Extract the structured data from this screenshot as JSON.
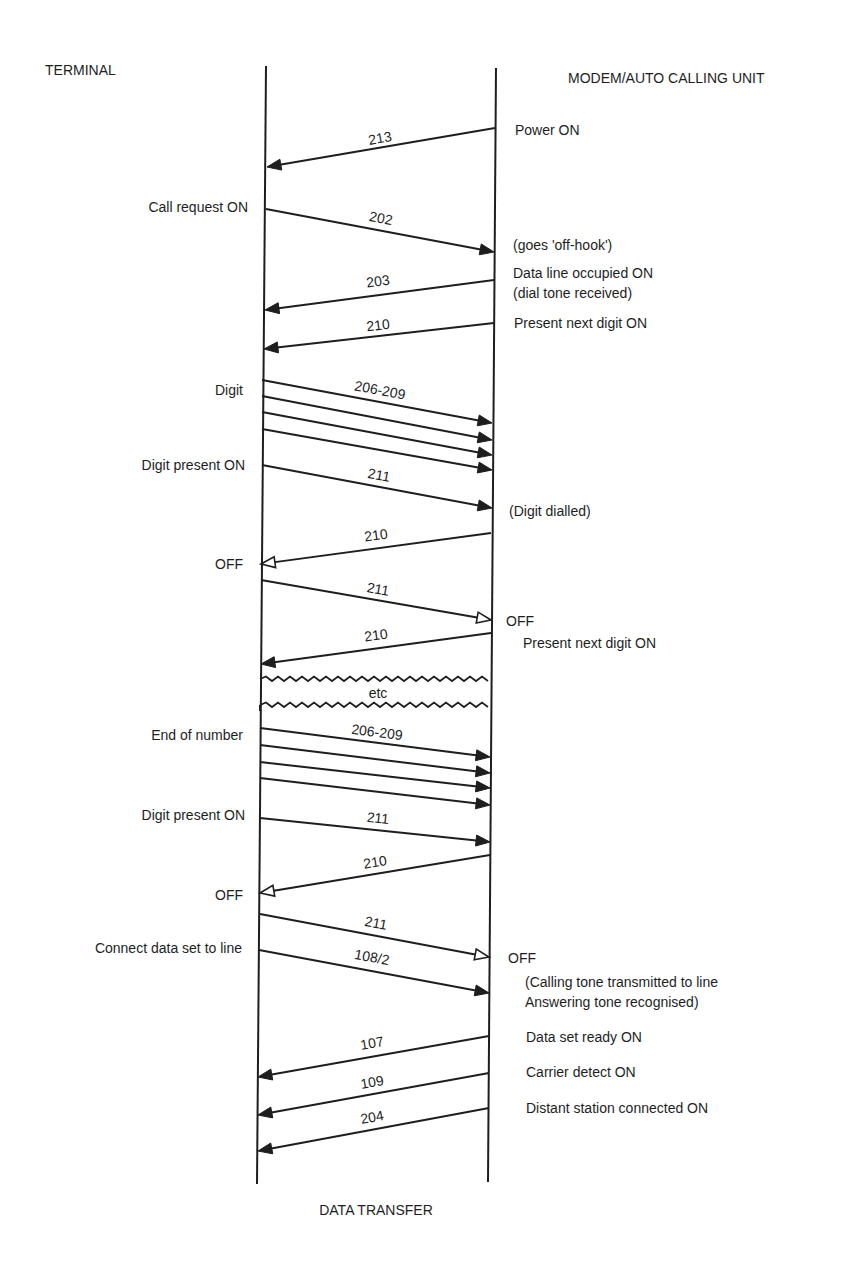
{
  "headers": {
    "left": "TERMINAL",
    "right": "MODEM/AUTO CALLING UNIT",
    "footer": "DATA TRANSFER",
    "break_label": "etc"
  },
  "colors": {
    "ink": "#1e1e1e",
    "background": "#ffffff"
  },
  "lifelines": {
    "terminal": {
      "x_top": 266,
      "x_bottom": 257,
      "y_top": 66,
      "y_bottom": 1184
    },
    "modem": {
      "x_top": 496,
      "x_bottom": 488,
      "y_top": 68,
      "y_bottom": 1182
    }
  },
  "break": {
    "top_y": 679,
    "bottom_y": 705
  },
  "left_labels": [
    {
      "text": "Call request ON",
      "x": 248,
      "y": 207
    },
    {
      "text": "Digit",
      "x": 243,
      "y": 390
    },
    {
      "text": "Digit present ON",
      "x": 245,
      "y": 465
    },
    {
      "text": "OFF",
      "x": 243,
      "y": 564
    },
    {
      "text": "End of number",
      "x": 243,
      "y": 735
    },
    {
      "text": "Digit present ON",
      "x": 245,
      "y": 815
    },
    {
      "text": "OFF",
      "x": 243,
      "y": 895
    },
    {
      "text": "Connect data set to line",
      "x": 242,
      "y": 948
    }
  ],
  "right_labels": [
    {
      "text": "Power ON",
      "x": 515,
      "y": 130
    },
    {
      "text": "(goes 'off-hook')",
      "x": 513,
      "y": 245
    },
    {
      "text": "Data line occupied ON",
      "x": 513,
      "y": 273
    },
    {
      "text": "(dial tone received)",
      "x": 513,
      "y": 293
    },
    {
      "text": "Present next digit ON",
      "x": 514,
      "y": 323
    },
    {
      "text": "(Digit dialled)",
      "x": 509,
      "y": 511
    },
    {
      "text": "OFF",
      "x": 506,
      "y": 621
    },
    {
      "text": "Present next digit ON",
      "x": 523,
      "y": 643
    },
    {
      "text": "OFF",
      "x": 508,
      "y": 958
    },
    {
      "text": "(Calling tone transmitted to line",
      "x": 525,
      "y": 982
    },
    {
      "text": "Answering tone recognised)",
      "x": 525,
      "y": 1002
    },
    {
      "text": "Data set ready ON",
      "x": 526,
      "y": 1037
    },
    {
      "text": "Carrier detect ON",
      "x": 526,
      "y": 1072
    },
    {
      "text": "Distant station connected ON",
      "x": 526,
      "y": 1108
    }
  ],
  "messages": [
    {
      "circuit": "213",
      "direction": "modem-to-terminal",
      "x1": 495,
      "y1": 128,
      "x2": 267,
      "y2": 167,
      "head": "filled",
      "label_x": 380,
      "label_y": 138
    },
    {
      "circuit": "202",
      "direction": "terminal-to-modem",
      "x1": 266,
      "y1": 209,
      "x2": 494,
      "y2": 252,
      "head": "filled",
      "label_x": 381,
      "label_y": 218
    },
    {
      "circuit": "203",
      "direction": "modem-to-terminal",
      "x1": 494,
      "y1": 280,
      "x2": 265,
      "y2": 310,
      "head": "filled",
      "label_x": 378,
      "label_y": 281
    },
    {
      "circuit": "210",
      "direction": "modem-to-terminal",
      "x1": 494,
      "y1": 323,
      "x2": 264,
      "y2": 349,
      "head": "filled",
      "label_x": 378,
      "label_y": 325
    },
    {
      "circuit": "206-209",
      "direction": "terminal-to-modem",
      "x1": 262,
      "y1": 380,
      "x2": 492,
      "y2": 423,
      "head": "filled",
      "label_x": 380,
      "label_y": 390
    },
    {
      "circuit": "",
      "direction": "terminal-to-modem",
      "x1": 262,
      "y1": 396,
      "x2": 492,
      "y2": 440,
      "head": "filled"
    },
    {
      "circuit": "",
      "direction": "terminal-to-modem",
      "x1": 262,
      "y1": 412,
      "x2": 492,
      "y2": 455,
      "head": "filled"
    },
    {
      "circuit": "",
      "direction": "terminal-to-modem",
      "x1": 262,
      "y1": 429,
      "x2": 492,
      "y2": 470,
      "head": "filled"
    },
    {
      "circuit": "211",
      "direction": "terminal-to-modem",
      "x1": 262,
      "y1": 465,
      "x2": 492,
      "y2": 508,
      "head": "filled",
      "label_x": 379,
      "label_y": 475
    },
    {
      "circuit": "210",
      "direction": "modem-to-terminal",
      "x1": 491,
      "y1": 533,
      "x2": 261,
      "y2": 564,
      "head": "open",
      "label_x": 376,
      "label_y": 535
    },
    {
      "circuit": "211",
      "direction": "terminal-to-modem",
      "x1": 261,
      "y1": 580,
      "x2": 491,
      "y2": 620,
      "head": "open",
      "label_x": 378,
      "label_y": 589
    },
    {
      "circuit": "210",
      "direction": "modem-to-terminal",
      "x1": 491,
      "y1": 633,
      "x2": 261,
      "y2": 664,
      "head": "filled",
      "label_x": 376,
      "label_y": 635
    },
    {
      "circuit": "206-209",
      "direction": "terminal-to-modem",
      "x1": 260,
      "y1": 728,
      "x2": 490,
      "y2": 757,
      "head": "filled",
      "label_x": 377,
      "label_y": 732
    },
    {
      "circuit": "",
      "direction": "terminal-to-modem",
      "x1": 260,
      "y1": 745,
      "x2": 490,
      "y2": 773,
      "head": "filled"
    },
    {
      "circuit": "",
      "direction": "terminal-to-modem",
      "x1": 260,
      "y1": 762,
      "x2": 490,
      "y2": 788,
      "head": "filled"
    },
    {
      "circuit": "",
      "direction": "terminal-to-modem",
      "x1": 260,
      "y1": 778,
      "x2": 490,
      "y2": 805,
      "head": "filled"
    },
    {
      "circuit": "211",
      "direction": "terminal-to-modem",
      "x1": 260,
      "y1": 818,
      "x2": 490,
      "y2": 842,
      "head": "filled",
      "label_x": 378,
      "label_y": 818
    },
    {
      "circuit": "210",
      "direction": "modem-to-terminal",
      "x1": 490,
      "y1": 855,
      "x2": 260,
      "y2": 893,
      "head": "open",
      "label_x": 375,
      "label_y": 862
    },
    {
      "circuit": "211",
      "direction": "terminal-to-modem",
      "x1": 260,
      "y1": 914,
      "x2": 489,
      "y2": 957,
      "head": "open",
      "label_x": 376,
      "label_y": 923
    },
    {
      "circuit": "108/2",
      "direction": "terminal-to-modem",
      "x1": 259,
      "y1": 950,
      "x2": 489,
      "y2": 993,
      "head": "filled",
      "label_x": 372,
      "label_y": 957
    },
    {
      "circuit": "107",
      "direction": "modem-to-terminal",
      "x1": 489,
      "y1": 1036,
      "x2": 258,
      "y2": 1077,
      "head": "filled",
      "label_x": 372,
      "label_y": 1043
    },
    {
      "circuit": "109",
      "direction": "modem-to-terminal",
      "x1": 489,
      "y1": 1073,
      "x2": 258,
      "y2": 1115,
      "head": "filled",
      "label_x": 372,
      "label_y": 1082
    },
    {
      "circuit": "204",
      "direction": "modem-to-terminal",
      "x1": 489,
      "y1": 1108,
      "x2": 258,
      "y2": 1151,
      "head": "filled",
      "label_x": 372,
      "label_y": 1117
    }
  ]
}
